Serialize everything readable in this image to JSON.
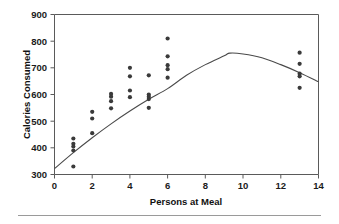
{
  "chart_data": {
    "type": "scatter",
    "title": "",
    "xlabel": "Persons at Meal",
    "ylabel": "Calories Consumed",
    "xlim": [
      0,
      14
    ],
    "ylim": [
      300,
      900
    ],
    "xticks": [
      0,
      2,
      4,
      6,
      8,
      10,
      12,
      14
    ],
    "yticks": [
      300,
      400,
      500,
      600,
      700,
      800,
      900
    ],
    "xtick_labels": [
      "0",
      "2",
      "4",
      "6",
      "8",
      "10",
      "12",
      "14"
    ],
    "ytick_labels": [
      "300",
      "400",
      "500",
      "600",
      "700",
      "800",
      "900"
    ],
    "grid": false,
    "legend": null,
    "legend_position": "none",
    "marker": "filled-circle",
    "marker_color": "#3a3a3a",
    "series": [
      {
        "name": "Observations",
        "type": "scatter",
        "points": [
          [
            1,
            435
          ],
          [
            1,
            415
          ],
          [
            1,
            405
          ],
          [
            1,
            390
          ],
          [
            1,
            330
          ],
          [
            2,
            535
          ],
          [
            2,
            510
          ],
          [
            2,
            455
          ],
          [
            3,
            602
          ],
          [
            3,
            592
          ],
          [
            3,
            575
          ],
          [
            3,
            548
          ],
          [
            4,
            700
          ],
          [
            4,
            668
          ],
          [
            4,
            615
          ],
          [
            4,
            590
          ],
          [
            5,
            672
          ],
          [
            5,
            600
          ],
          [
            5,
            592
          ],
          [
            5,
            583
          ],
          [
            5,
            550
          ],
          [
            6,
            810
          ],
          [
            6,
            743
          ],
          [
            6,
            710
          ],
          [
            6,
            695
          ],
          [
            6,
            663
          ],
          [
            13,
            757
          ],
          [
            13,
            715
          ],
          [
            13,
            678
          ],
          [
            13,
            668
          ],
          [
            13,
            625
          ]
        ]
      },
      {
        "name": "Quadratic fit",
        "type": "line",
        "color": "#4a4a4a",
        "equation_points": [
          [
            0,
            322
          ],
          [
            1,
            382
          ],
          [
            2,
            438
          ],
          [
            3,
            490
          ],
          [
            4,
            538
          ],
          [
            5,
            582
          ],
          [
            6,
            622
          ],
          [
            7,
            672
          ],
          [
            8,
            712
          ],
          [
            9,
            745
          ],
          [
            9.3,
            755
          ],
          [
            10,
            752
          ],
          [
            11,
            738
          ],
          [
            12,
            712
          ],
          [
            13,
            682
          ],
          [
            14,
            648
          ]
        ]
      }
    ]
  },
  "axes": {
    "x_title": "Persons at Meal",
    "y_title": "Calories Consumed"
  }
}
